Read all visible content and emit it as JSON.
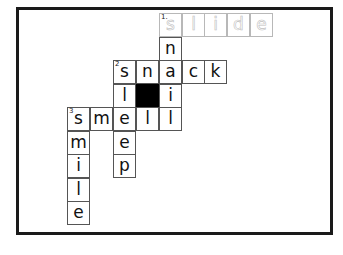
{
  "puzzle": {
    "type": "crossword",
    "grid_origin": {
      "x": 67,
      "y": 13
    },
    "cell_size": {
      "w": 23,
      "h": 23.5
    },
    "cells": [
      {
        "row": 0,
        "col": 4,
        "letter": "s",
        "number": "1",
        "style": "faded"
      },
      {
        "row": 0,
        "col": 5,
        "letter": "l",
        "style": "faded"
      },
      {
        "row": 0,
        "col": 6,
        "letter": "i",
        "style": "faded"
      },
      {
        "row": 0,
        "col": 7,
        "letter": "d",
        "style": "faded"
      },
      {
        "row": 0,
        "col": 8,
        "letter": "e",
        "style": "faded"
      },
      {
        "row": 1,
        "col": 4,
        "letter": "n"
      },
      {
        "row": 2,
        "col": 2,
        "letter": "s",
        "number": "2"
      },
      {
        "row": 2,
        "col": 3,
        "letter": "n"
      },
      {
        "row": 2,
        "col": 4,
        "letter": "a"
      },
      {
        "row": 2,
        "col": 5,
        "letter": "c"
      },
      {
        "row": 2,
        "col": 6,
        "letter": "k"
      },
      {
        "row": 3,
        "col": 2,
        "letter": "l"
      },
      {
        "row": 3,
        "col": 3,
        "letter": "",
        "style": "black"
      },
      {
        "row": 3,
        "col": 4,
        "letter": "i"
      },
      {
        "row": 4,
        "col": 0,
        "letter": "s",
        "number": "3"
      },
      {
        "row": 4,
        "col": 1,
        "letter": "m"
      },
      {
        "row": 4,
        "col": 2,
        "letter": "e"
      },
      {
        "row": 4,
        "col": 3,
        "letter": "l"
      },
      {
        "row": 4,
        "col": 4,
        "letter": "l"
      },
      {
        "row": 5,
        "col": 0,
        "letter": "m"
      },
      {
        "row": 5,
        "col": 2,
        "letter": "e"
      },
      {
        "row": 6,
        "col": 0,
        "letter": "i"
      },
      {
        "row": 6,
        "col": 2,
        "letter": "p"
      },
      {
        "row": 7,
        "col": 0,
        "letter": "l"
      },
      {
        "row": 8,
        "col": 0,
        "letter": "e"
      }
    ],
    "words": {
      "across": [
        "slide",
        "snack",
        "smell"
      ],
      "down": [
        "snail",
        "sleep",
        "smile"
      ]
    }
  }
}
